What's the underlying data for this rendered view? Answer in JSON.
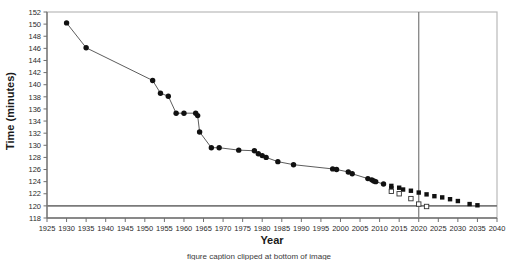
{
  "chart_data": {
    "type": "scatter",
    "title": "",
    "xlabel": "Year",
    "ylabel": "Time (minutes)",
    "xlim": [
      1925,
      2040
    ],
    "ylim": [
      118,
      152
    ],
    "xticks": [
      1925,
      1930,
      1935,
      1940,
      1945,
      1950,
      1955,
      1960,
      1965,
      1970,
      1975,
      1980,
      1985,
      1990,
      1995,
      2000,
      2005,
      2010,
      2015,
      2020,
      2025,
      2030,
      2035,
      2040
    ],
    "yticks": [
      118,
      120,
      122,
      124,
      126,
      128,
      130,
      132,
      134,
      136,
      138,
      140,
      142,
      144,
      146,
      148,
      150,
      152
    ],
    "grid": false,
    "legend": "none",
    "reference_lines": [
      {
        "name": "two-hour-barrier",
        "orientation": "horizontal",
        "value": 120
      },
      {
        "name": "present-year-marker",
        "orientation": "vertical",
        "value": 2020
      }
    ],
    "series": [
      {
        "name": "world-record-history",
        "marker": "filled-circle",
        "line": true,
        "points": [
          [
            1930,
            150.2
          ],
          [
            1935,
            146.1
          ],
          [
            1952,
            140.7
          ],
          [
            1954,
            138.6
          ],
          [
            1956,
            138.1
          ],
          [
            1958,
            135.3
          ],
          [
            1960,
            135.3
          ],
          [
            1963,
            135.3
          ],
          [
            1963.5,
            134.9
          ],
          [
            1964,
            132.2
          ],
          [
            1967,
            129.6
          ],
          [
            1969,
            129.6
          ],
          [
            1974,
            129.2
          ],
          [
            1978,
            129.1
          ],
          [
            1979,
            128.6
          ],
          [
            1980,
            128.3
          ],
          [
            1981,
            128.0
          ],
          [
            1984,
            127.3
          ],
          [
            1988,
            126.8
          ],
          [
            1998,
            126.1
          ],
          [
            1999,
            126.0
          ],
          [
            2002,
            125.6
          ],
          [
            2003,
            125.3
          ],
          [
            2007,
            124.5
          ],
          [
            2008,
            124.3
          ],
          [
            2008.5,
            124.1
          ],
          [
            2009,
            124.0
          ],
          [
            2011,
            123.6
          ]
        ]
      },
      {
        "name": "projection-upper",
        "marker": "filled-square",
        "line": false,
        "points": [
          [
            2013,
            123.3
          ],
          [
            2013,
            122.9
          ],
          [
            2015,
            123.0
          ],
          [
            2016,
            122.7
          ],
          [
            2018,
            122.5
          ],
          [
            2020,
            122.2
          ],
          [
            2022,
            121.9
          ],
          [
            2024,
            121.6
          ],
          [
            2026,
            121.4
          ],
          [
            2028,
            121.1
          ],
          [
            2030,
            120.8
          ],
          [
            2033,
            120.3
          ],
          [
            2035,
            120.1
          ]
        ]
      },
      {
        "name": "projection-lower",
        "marker": "open-square",
        "line": false,
        "points": [
          [
            2013,
            122.4
          ],
          [
            2015,
            122.0
          ],
          [
            2018,
            121.2
          ],
          [
            2020,
            120.3
          ],
          [
            2022,
            119.9
          ]
        ]
      }
    ]
  },
  "axes": {
    "y_title": "Time (minutes)",
    "x_title": "Year"
  },
  "caption": {
    "text": "figure caption clipped at bottom of image"
  }
}
